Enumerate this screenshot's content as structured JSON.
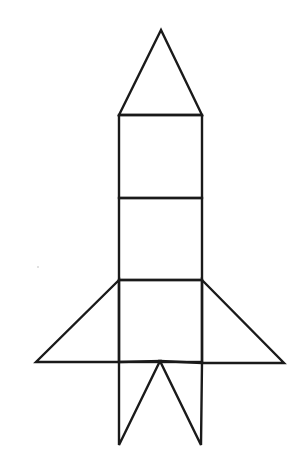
{
  "diagram": {
    "title": "Rocket made of geometric shapes",
    "stroke_color": "#1a1a1a",
    "background": "#ffffff",
    "stroke_width": 2.4,
    "shapes": [
      {
        "name": "nose-cone-triangle",
        "type": "polygon",
        "points": [
          [
            161,
            30
          ],
          [
            119,
            115
          ],
          [
            202,
            115
          ]
        ]
      },
      {
        "name": "body-upper-square",
        "type": "rect",
        "x": 119,
        "y": 115,
        "w": 83,
        "h": 83
      },
      {
        "name": "body-middle-square",
        "type": "rect",
        "x": 119,
        "y": 198,
        "w": 83,
        "h": 82
      },
      {
        "name": "body-lower-square",
        "type": "rect",
        "x": 119,
        "y": 280,
        "w": 83,
        "h": 82
      },
      {
        "name": "left-fin-triangle",
        "type": "polygon",
        "points": [
          [
            119,
            280
          ],
          [
            36,
            362
          ],
          [
            119,
            362
          ]
        ]
      },
      {
        "name": "right-fin-triangle",
        "type": "polygon",
        "points": [
          [
            202,
            280
          ],
          [
            284,
            363
          ],
          [
            202,
            363
          ]
        ]
      },
      {
        "name": "left-exhaust-triangle",
        "type": "polygon",
        "points": [
          [
            119,
            362
          ],
          [
            160,
            361
          ],
          [
            119,
            445
          ]
        ]
      },
      {
        "name": "right-exhaust-triangle",
        "type": "polygon",
        "points": [
          [
            160,
            361
          ],
          [
            202,
            363
          ],
          [
            201,
            445
          ]
        ]
      }
    ],
    "speck": {
      "x": 38,
      "y": 267,
      "r": 0.8,
      "color": "#bbbbbb"
    }
  }
}
